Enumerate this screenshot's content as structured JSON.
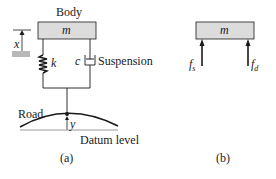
{
  "figure_a": {
    "body_label": "Body",
    "mass_label": "m",
    "displacement_label": "x",
    "spring_label": "k",
    "damper_label": "c",
    "suspension_label": "Suspension",
    "road_label": "Road",
    "road_displacement_label": "y",
    "datum_label": "Datum level",
    "caption": "(a)"
  },
  "figure_b": {
    "mass_label": "m",
    "spring_force_label": "f",
    "spring_force_sub": "s",
    "damper_force_label": "f",
    "damper_force_sub": "d",
    "caption": "(b)"
  },
  "colors": {
    "mass_fill": "#dcdcdc",
    "stroke": "#1a1a1a",
    "ground_fill": "#b8b8b8"
  }
}
